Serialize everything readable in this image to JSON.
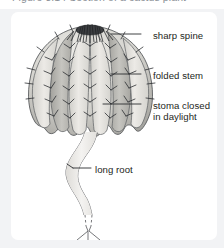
{
  "caption": {
    "text": "Figure 3.14 Section of a cactus plant",
    "visible_state": "clipped"
  },
  "figure": {
    "subject": "cactus",
    "colors": {
      "panel_background": "#ffffff",
      "page_background": "#f2f3f5",
      "ink": "#1d1f22",
      "stem_light": "#e3e2de",
      "stem_mid": "#c9c8c3",
      "stem_dark": "#a9a8a3",
      "root_fill": "#f0efec",
      "leader_line": "#2a2c2f"
    },
    "labels": [
      {
        "id": "sharp-spine",
        "text": "sharp spine",
        "lines": [
          "sharp spine"
        ],
        "points_to": "spine on stem ridge",
        "leader": "horizontal"
      },
      {
        "id": "folded-stem",
        "text": "folded stem",
        "lines": [
          "folded stem"
        ],
        "points_to": "ribbed stem surface",
        "leader": "horizontal"
      },
      {
        "id": "stoma-closed-in-daylight",
        "text": "stoma closed in daylight",
        "lines": [
          "stoma closed",
          "in daylight"
        ],
        "points_to": "stem epidermis",
        "leader": "horizontal"
      },
      {
        "id": "long-root",
        "text": "long root",
        "lines": [
          "long root"
        ],
        "points_to": "taproot",
        "leader": "horizontal"
      }
    ],
    "parts": [
      {
        "name": "crown",
        "description": "dense cluster of spines converging at apex"
      },
      {
        "name": "folded stem",
        "description": "vertically ribbed swollen stem with scalloped lower edge"
      },
      {
        "name": "spines",
        "description": "short sharp spines along each rib ridge"
      },
      {
        "name": "long root",
        "description": "long wavy taproot with dashed break, forking at base"
      }
    ]
  }
}
